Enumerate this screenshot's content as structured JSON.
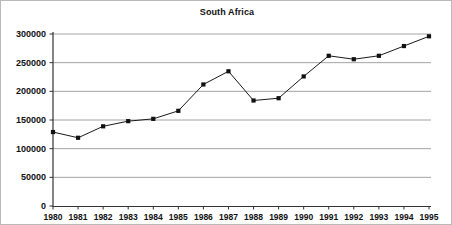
{
  "chart_data": {
    "type": "line",
    "title": "South Africa",
    "xlabel": "",
    "ylabel": "",
    "categories": [
      "1980",
      "1981",
      "1982",
      "1983",
      "1984",
      "1985",
      "1986",
      "1987",
      "1988",
      "1989",
      "1990",
      "1991",
      "1992",
      "1993",
      "1994",
      "1995"
    ],
    "values": [
      129000,
      119000,
      139000,
      148000,
      152000,
      166000,
      212000,
      235000,
      184000,
      188000,
      226000,
      262000,
      256000,
      262000,
      279000,
      296000
    ],
    "ylim": [
      0,
      300000
    ],
    "ytick_labels": [
      "0",
      "50000",
      "100000",
      "150000",
      "200000",
      "250000",
      "300000"
    ],
    "ytick_values": [
      0,
      50000,
      100000,
      150000,
      200000,
      250000,
      300000
    ],
    "xtick_labels": [
      "1980",
      "1981",
      "1982",
      "1983",
      "1984",
      "1985",
      "1986",
      "1987",
      "1988",
      "1989",
      "1990",
      "1991",
      "1992",
      "1993",
      "1994",
      "1995"
    ],
    "grid": true,
    "grid_axis": "y",
    "legend": false,
    "marker": "square",
    "line_color": "#1a1a1a",
    "marker_color": "#111111",
    "grid_color": "#9a9a9a",
    "axis_color": "#333333",
    "background_color": "#ffffff"
  }
}
